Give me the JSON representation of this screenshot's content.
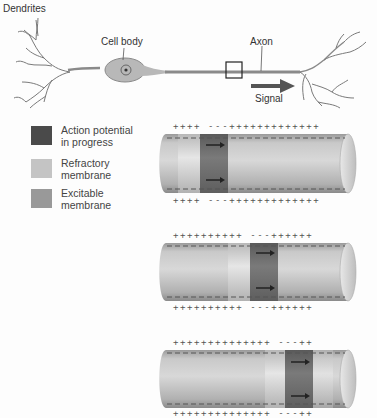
{
  "neuron": {
    "labels": {
      "dendrites": "Dendrites",
      "cell_body": "Cell body",
      "axon": "Axon",
      "signal": "Signal"
    }
  },
  "legend": {
    "items": [
      {
        "line1": "Action potential",
        "line2": "in progress",
        "color": "#4a4a4a"
      },
      {
        "line1": "Refractory",
        "line2": "membrane",
        "color": "#c4c4c4"
      },
      {
        "line1": "Excitable",
        "line2": "membrane",
        "color": "#999999"
      }
    ]
  },
  "colors": {
    "cylinder_light": "#dcdcdc",
    "cylinder_mid": "#b5b5b5",
    "cylinder_dark": "#8f8f8f",
    "action_band": "#6a6a6a",
    "refractory_band": "#d2d2d2"
  },
  "cylinders": [
    {
      "top_charges": "++++ ---+++++++++++++",
      "bottom_charges": "++++ ---+++++++++++++"
    },
    {
      "top_charges": "++++++++++ ---++++++",
      "bottom_charges": "++++++++++ ---++++++"
    },
    {
      "top_charges": "++++++++++++++ ---++",
      "bottom_charges": "++++++++++++++ ---++"
    }
  ]
}
